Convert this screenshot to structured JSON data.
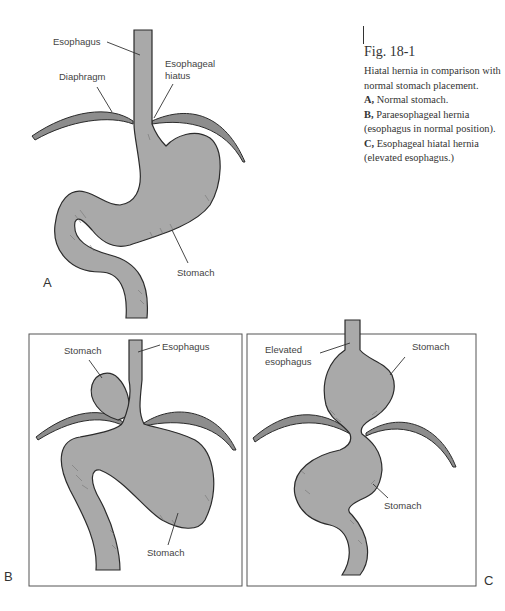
{
  "caption": {
    "title": "Fig. 18-1",
    "intro": "Hiatal hernia in comparison with normal stomach placement.",
    "items": [
      {
        "letter": "A,",
        "text": "Normal stomach."
      },
      {
        "letter": "B,",
        "text": "Paraesophageal hernia (esophagus in normal position)."
      },
      {
        "letter": "C,",
        "text": "Esophageal hiatal hernia (elevated esophagus.)"
      }
    ]
  },
  "panels": {
    "A": {
      "letter": "A",
      "labels": {
        "esophagus": "Esophagus",
        "diaphragm": "Diaphragm",
        "hiatus_line1": "Esophageal",
        "hiatus_line2": "hiatus",
        "stomach": "Stomach"
      }
    },
    "B": {
      "letter": "B",
      "labels": {
        "stomach_upper": "Stomach",
        "esophagus": "Esophagus",
        "stomach_lower": "Stomach"
      }
    },
    "C": {
      "letter": "C",
      "labels": {
        "elevated_line1": "Elevated",
        "elevated_line2": "esophagus",
        "stomach_upper": "Stomach",
        "stomach_lower": "Stomach"
      }
    }
  },
  "colors": {
    "organ_fill": "#a9a9a9",
    "diaphragm_fill": "#8d8d8d",
    "outline": "#2b2b2b",
    "frame": "#555555"
  }
}
